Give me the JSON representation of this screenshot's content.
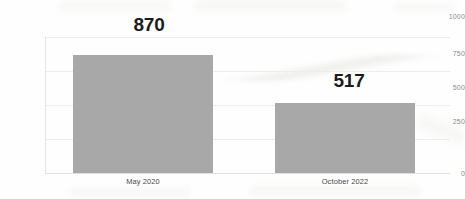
{
  "chart_data": {
    "type": "bar",
    "title": "",
    "subtitle": "",
    "xlabel": "",
    "ylabel": "",
    "categories": [
      "May 2020",
      "October 2022"
    ],
    "values": [
      870,
      517
    ],
    "data_labels": [
      "870",
      "517"
    ],
    "ylim": [
      0,
      1000
    ],
    "y_ticks": [
      0,
      250,
      500,
      750,
      1000
    ],
    "y_tick_labels": [
      "0",
      "250",
      "500",
      "750",
      "1000"
    ],
    "grid": true,
    "grid_axis": "y",
    "legend": false,
    "legend_position": "none",
    "series": [
      {
        "name": "",
        "values": [
          870,
          517
        ]
      }
    ]
  },
  "style": {
    "bar_color": "#a8a8a8",
    "grid_color": "#eceded",
    "axis_color": "#e4e5e5",
    "label_color": "#1b1b1b",
    "tick_color": "#8c8c8c",
    "category_color": "#4a4a4a",
    "background": "#fefefe"
  }
}
